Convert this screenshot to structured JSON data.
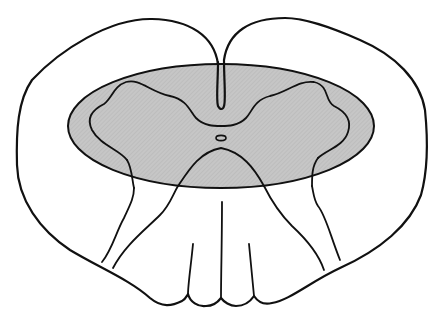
{
  "diagram": {
    "type": "anatomical-cross-section",
    "labels": [],
    "colors": {
      "background": "#ffffff",
      "outline": "#111111",
      "shaded_region": "#c4c4c4",
      "white_matter": "#ffffff"
    },
    "elements": [
      {
        "name": "outer-outline",
        "description": "bilobed outer contour of the cord"
      },
      {
        "name": "shaded-ellipse",
        "description": "horizontal gray shaded elliptical band"
      },
      {
        "name": "gray-matter-outline",
        "description": "butterfly-shaped gray matter contour"
      },
      {
        "name": "dorsal-median-septum",
        "description": "narrow median fissure dropping from top notch"
      },
      {
        "name": "central-canal",
        "description": "small oval at center"
      },
      {
        "name": "ventral-rootlets",
        "description": "lines fanning downward to bottom lobes"
      }
    ]
  }
}
